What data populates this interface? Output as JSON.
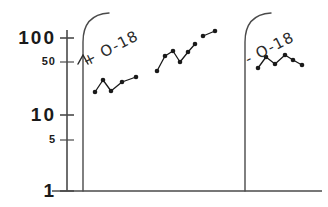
{
  "figure": {
    "background_color": "#ffffff",
    "ink_color": "#1a1a1a",
    "axis_color": "#4a4a4a"
  },
  "yaxis": {
    "scale": "log",
    "ticks": [
      {
        "label": "100",
        "value": 100,
        "y": 38,
        "style": "major"
      },
      {
        "label": "50",
        "value": 50,
        "y": 62,
        "style": "minor"
      },
      {
        "label": "10",
        "value": 10,
        "y": 115,
        "style": "major"
      },
      {
        "label": "5",
        "value": 5,
        "y": 140,
        "style": "minor"
      },
      {
        "label": "1",
        "value": 1,
        "y": 191,
        "style": "major"
      }
    ]
  },
  "annotations": [
    {
      "name": "plus-o18-label",
      "text": "+ O-18",
      "x": 88,
      "y": 52
    },
    {
      "name": "minus-o18-label",
      "text": "- O-18",
      "x": 250,
      "y": 50
    }
  ],
  "chart_data": {
    "type": "line",
    "title": "",
    "xlabel": "",
    "ylabel": "",
    "yscale": "log",
    "ylim": [
      1,
      130
    ],
    "ytick_labels": [
      "1",
      "5",
      "10",
      "50",
      "100"
    ],
    "ytick_values": [
      1,
      5,
      10,
      50,
      100
    ],
    "grid": false,
    "legend": "none",
    "annotations": [
      "+ O-18",
      "- O-18"
    ],
    "dividers_x_px": [
      83,
      245
    ],
    "series": [
      {
        "name": "segment-1",
        "group": "+ O-18",
        "points_px": [
          {
            "x": 95,
            "y": 92
          },
          {
            "x": 103,
            "y": 80
          },
          {
            "x": 111,
            "y": 91
          },
          {
            "x": 122,
            "y": 82
          },
          {
            "x": 136,
            "y": 77
          }
        ],
        "values": [
          22,
          30,
          23,
          28,
          32
        ]
      },
      {
        "name": "segment-2",
        "group": "+ O-18",
        "points_px": [
          {
            "x": 157,
            "y": 71
          },
          {
            "x": 165,
            "y": 56
          },
          {
            "x": 173,
            "y": 51
          },
          {
            "x": 180,
            "y": 62
          },
          {
            "x": 188,
            "y": 52
          },
          {
            "x": 195,
            "y": 44
          }
        ],
        "values": [
          38,
          57,
          64,
          48,
          62,
          76
        ]
      },
      {
        "name": "segment-3",
        "group": "+ O-18",
        "points_px": [
          {
            "x": 203,
            "y": 36
          },
          {
            "x": 215,
            "y": 31
          }
        ],
        "values": [
          95,
          110
        ]
      },
      {
        "name": "segment-4",
        "group": "- O-18",
        "points_px": [
          {
            "x": 258,
            "y": 68
          },
          {
            "x": 266,
            "y": 57
          },
          {
            "x": 275,
            "y": 64
          },
          {
            "x": 285,
            "y": 55
          },
          {
            "x": 293,
            "y": 60
          },
          {
            "x": 302,
            "y": 65
          }
        ],
        "values": [
          42,
          55,
          46,
          58,
          50,
          44
        ]
      }
    ]
  }
}
